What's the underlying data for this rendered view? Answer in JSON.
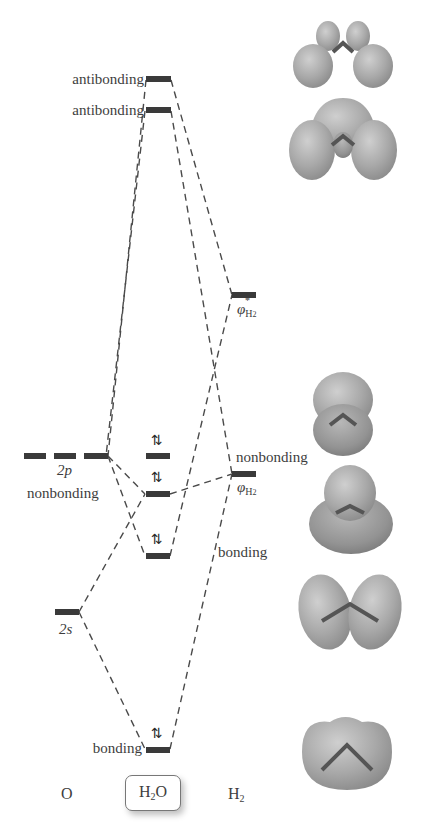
{
  "diagram": {
    "type": "molecular-orbital-energy-diagram",
    "species": {
      "left": "O",
      "center_prefix": "H",
      "center_sub": "2",
      "center_suffix": "O",
      "right_prefix": "H",
      "right_sub": "2"
    },
    "levels": {
      "antibonding_1": "antibonding",
      "antibonding_2": "antibonding",
      "oxygen_2p": "2p",
      "nonbonding_left": "nonbonding",
      "nonbonding_right": "nonbonding",
      "oxygen_2s": "2s",
      "bonding_right": "bonding",
      "bonding_bottom": "bonding",
      "phi_star_symbol": "φ",
      "phi_star_sub": "H",
      "phi_star_sub2": "2",
      "phi_star_sup": "*",
      "phi_symbol": "φ",
      "phi_sub": "H",
      "phi_sub2": "2"
    },
    "electron_pairs": [
      "⇅",
      "⇅",
      "⇅",
      "⇅"
    ],
    "orbital_images": [
      "antibonding-orbital-1-surface",
      "antibonding-orbital-2-surface",
      "nonbonding-orbital-surface",
      "nonbonding-lone-pair-surface",
      "bonding-orbital-surface",
      "bonding-lowest-orbital-surface"
    ],
    "colors": {
      "bar": "#3a3a3a",
      "dash": "#4a4a4a",
      "orbital_fill": "#a9a9a9",
      "text": "#3d3d3d"
    }
  }
}
